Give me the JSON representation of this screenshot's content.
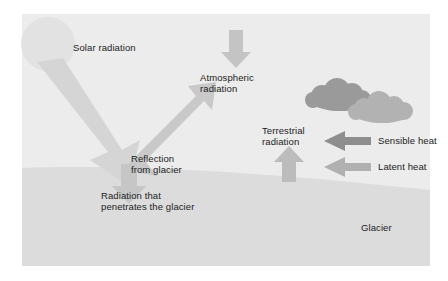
{
  "figure": {
    "type": "schematic-diagram"
  },
  "canvas": {
    "width": 448,
    "height": 281,
    "background": "#ffffff"
  },
  "panel": {
    "sky_color": "#ececec",
    "glacier_color": "#dcdcdc",
    "left": 22,
    "top": 14,
    "right": 430,
    "bottom": 266
  },
  "colors": {
    "sun": "#e2e2e2",
    "solar_arrow": "#d5d5d5",
    "reflection_arrow": "#c9c9c9",
    "penetrating_arrow": "#c6c6c6",
    "atmospheric_arrow": "#c4c4c4",
    "terrestrial_arrow": "#bcbcbc",
    "cloud_back": "#9a9a9a",
    "cloud_front": "#b2b2b2",
    "sensible_arrow": "#8e8e8e",
    "latent_arrow": "#b0b0b0",
    "text": "#222222"
  },
  "labels": {
    "solar_radiation": "Solar radiation",
    "atmospheric_radiation_line1": "Atmospheric",
    "atmospheric_radiation_line2": "radiation",
    "reflection_line1": "Reflection",
    "reflection_line2": "from glacier",
    "penetrating_line1": "Radiation that",
    "penetrating_line2": "penetrates the glacier",
    "terrestrial_line1": "Terrestrial",
    "terrestrial_line2": "radiation",
    "sensible_heat": "Sensible heat",
    "latent_heat": "Latent heat",
    "glacier": "Glacier"
  },
  "elements": {
    "sun": {
      "cx": 48,
      "cy": 44,
      "r": 27
    },
    "clouds": {
      "count": 2
    },
    "arrows": [
      {
        "name": "solar-radiation-arrow",
        "direction": "down-right"
      },
      {
        "name": "reflection-arrow",
        "direction": "up-right"
      },
      {
        "name": "penetrating-radiation-arrow",
        "direction": "down"
      },
      {
        "name": "atmospheric-radiation-arrow",
        "direction": "down"
      },
      {
        "name": "terrestrial-radiation-arrow",
        "direction": "up"
      },
      {
        "name": "sensible-heat-arrow",
        "direction": "left"
      },
      {
        "name": "latent-heat-arrow",
        "direction": "left"
      }
    ]
  }
}
